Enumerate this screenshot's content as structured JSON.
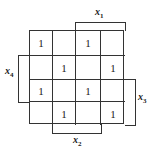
{
  "diagram": {
    "type": "karnaugh-map",
    "rows": 4,
    "cols": 4,
    "cells": [
      [
        "1",
        "",
        "1",
        ""
      ],
      [
        "",
        "1",
        "",
        "1"
      ],
      [
        "1",
        "",
        "1",
        ""
      ],
      [
        "",
        "1",
        "",
        "1"
      ]
    ],
    "labels": {
      "x1": {
        "var": "x",
        "sub": "1",
        "position": "top",
        "span": "columns 3-4"
      },
      "x2": {
        "var": "x",
        "sub": "2",
        "position": "bottom",
        "span": "columns 2-3"
      },
      "x3": {
        "var": "x",
        "sub": "3",
        "position": "right",
        "span": "rows 3-4"
      },
      "x4": {
        "var": "x",
        "sub": "4",
        "position": "left",
        "span": "rows 2-3"
      }
    }
  }
}
